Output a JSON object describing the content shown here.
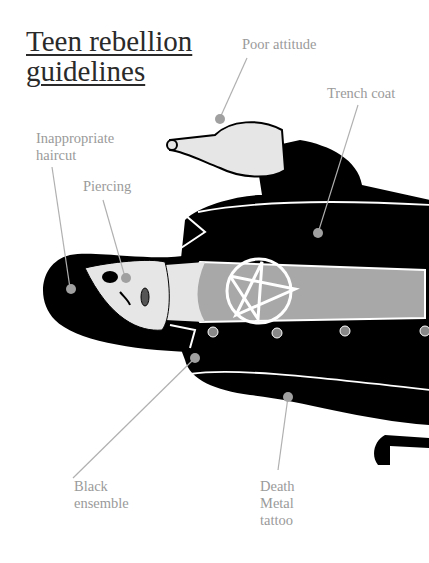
{
  "title": {
    "line1": "Teen rebellion",
    "line2": "guidelines"
  },
  "labels": {
    "poor_attitude": "Poor attitude",
    "trench_coat": "Trench coat",
    "inappropriate_haircut": {
      "line1": "Inappropriate",
      "line2": "haircut"
    },
    "piercing": "Piercing",
    "black_ensemble": {
      "line1": "Black",
      "line2": "ensemble"
    },
    "death_metal_tattoo": {
      "line1": "Death",
      "line2": "Metal",
      "line3": "tattoo"
    }
  },
  "colors": {
    "ink": "#000000",
    "skin": "#e6e6e6",
    "shirt": "#a8a8a8",
    "callout": "#9a9a9a",
    "title": "#2a2a2a"
  }
}
